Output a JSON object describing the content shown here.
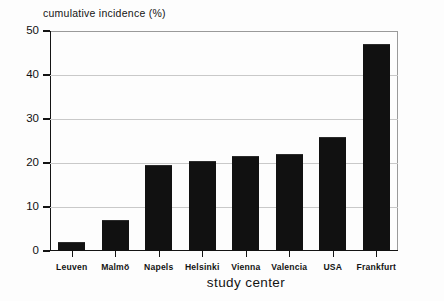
{
  "chart_data": {
    "type": "bar",
    "title": "",
    "ylabel": "cumulative incidence (%)",
    "xlabel": "study center",
    "categories": [
      "Leuven",
      "Malmö",
      "Napels",
      "Helsinki",
      "Vienna",
      "Valencia",
      "USA",
      "Frankfurt"
    ],
    "values": [
      2,
      7,
      19.5,
      20.5,
      21.5,
      22,
      26,
      47
    ],
    "ylim": [
      0,
      50
    ],
    "yticks": [
      0,
      10,
      20,
      30,
      40,
      50
    ],
    "ytick_labels": [
      "0",
      "10",
      "20",
      "30",
      "40",
      "50"
    ],
    "grid": "horizontal",
    "legend": "none",
    "bar_color": "#111111",
    "background_color": "#fdfdfd",
    "axis_color": "#141414",
    "gridline_color": "#c9c9c9"
  }
}
